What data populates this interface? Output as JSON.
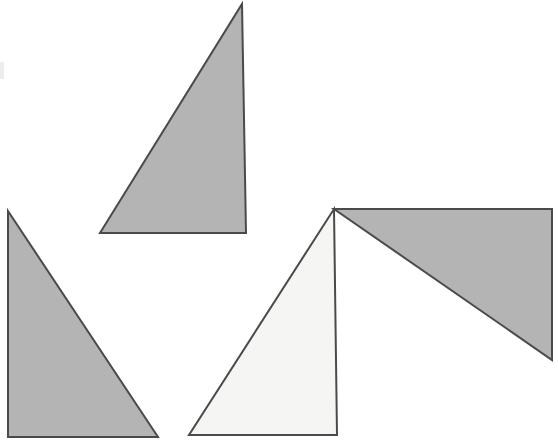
{
  "figure": {
    "canvas": {
      "width": 558,
      "height": 443,
      "background_color": "#ffffff"
    },
    "style": {
      "stroke_color": "#4a4a4a",
      "stroke_width": 2,
      "fill_gray": "#b4b4b4",
      "fill_light": "#f5f5f3"
    },
    "shapes": [
      {
        "id": "triangle-top",
        "label": "Top center shaded right triangle",
        "fill": "#b4b4b4",
        "stroke": "#4a4a4a",
        "points": "242,4 246,233 100,233",
        "orientation": "right angle at bottom-right"
      },
      {
        "id": "triangle-left",
        "label": "Lower left shaded right triangle",
        "fill": "#b4b4b4",
        "stroke": "#4a4a4a",
        "points": "8,211 158,437 8,437",
        "orientation": "right angle at bottom-left"
      },
      {
        "id": "triangle-center",
        "label": "Lower center light right triangle",
        "fill": "#f5f5f3",
        "stroke": "#4a4a4a",
        "points": "334,209 337,435 189,435",
        "orientation": "right angle at bottom-right"
      },
      {
        "id": "triangle-right",
        "label": "Right shaded right triangle clipped by frame edge",
        "fill": "#b4b4b4",
        "stroke": "#4a4a4a",
        "points": "334,209 552,209 552,360",
        "orientation": "right angle at top-right"
      }
    ],
    "artifacts": [
      {
        "id": "edge-mark",
        "label": "Faint scan artifact at left margin",
        "x": 0,
        "y": 62,
        "width": 4,
        "height": 17,
        "color": "#ededed"
      }
    ]
  }
}
